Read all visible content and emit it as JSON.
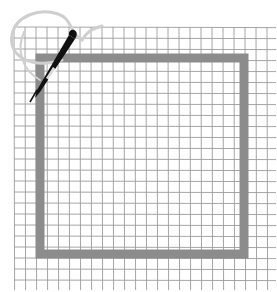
{
  "illustration": {
    "title": "Needlepoint canvas with stitched square frame",
    "background": "#ffffff",
    "grid": {
      "x0": 14,
      "y0": 27,
      "x1": 276,
      "y1": 290,
      "spacing": 11,
      "color": "#7a7a7a",
      "opacity": 0.75
    },
    "frame": {
      "x": 40,
      "y": 58,
      "width": 204,
      "height": 196,
      "stroke_width": 9,
      "color": "#8c8c8c"
    },
    "thread": {
      "color": "#c8c8c8"
    },
    "needle": {
      "color": "#111111",
      "eye_color": "#ffffff"
    }
  }
}
